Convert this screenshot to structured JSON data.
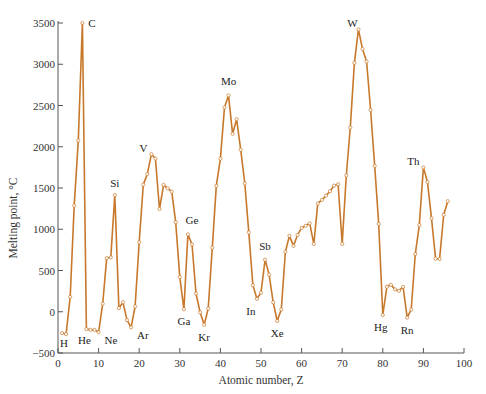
{
  "chart_data": {
    "type": "line",
    "title": "",
    "xlabel": "Atomic number, Z",
    "ylabel": "Melting point, °C",
    "xlim": [
      0,
      100
    ],
    "ylim": [
      -500,
      3500
    ],
    "xticks": [
      0,
      10,
      20,
      30,
      40,
      50,
      60,
      70,
      80,
      90,
      100
    ],
    "yticks": [
      -500,
      0,
      500,
      1000,
      1500,
      2000,
      2500,
      3000,
      3500
    ],
    "grid": false,
    "legend": null,
    "line_color": "#c8782a",
    "marker": "open-circle",
    "series": [
      {
        "name": "Melting point",
        "x": [
          1,
          2,
          3,
          4,
          5,
          6,
          7,
          8,
          9,
          10,
          11,
          12,
          13,
          14,
          15,
          16,
          17,
          18,
          19,
          20,
          21,
          22,
          23,
          24,
          25,
          26,
          27,
          28,
          29,
          30,
          31,
          32,
          33,
          34,
          35,
          36,
          37,
          38,
          39,
          40,
          41,
          42,
          43,
          44,
          45,
          46,
          47,
          48,
          49,
          50,
          51,
          52,
          53,
          54,
          55,
          56,
          57,
          58,
          59,
          60,
          61,
          62,
          63,
          64,
          65,
          66,
          67,
          68,
          69,
          70,
          71,
          72,
          73,
          74,
          75,
          76,
          77,
          78,
          79,
          80,
          81,
          82,
          83,
          84,
          85,
          86,
          87,
          88,
          89,
          90,
          91,
          92,
          93,
          94,
          95,
          96
        ],
        "values": [
          -259,
          -272,
          181,
          1287,
          2076,
          3500,
          -210,
          -218,
          -220,
          -249,
          98,
          650,
          660,
          1414,
          44,
          115,
          -102,
          -189,
          64,
          842,
          1541,
          1668,
          1910,
          1857,
          1246,
          1538,
          1495,
          1455,
          1085,
          420,
          30,
          938,
          817,
          221,
          -7,
          -157,
          39,
          777,
          1526,
          1855,
          2477,
          2623,
          2157,
          2334,
          1964,
          1555,
          962,
          321,
          157,
          232,
          631,
          450,
          114,
          -112,
          28,
          727,
          920,
          798,
          931,
          1016,
          1042,
          1072,
          822,
          1313,
          1356,
          1407,
          1461,
          1529,
          1545,
          824,
          1652,
          2233,
          3017,
          3422,
          3186,
          3033,
          2446,
          1768,
          1064,
          -39,
          304,
          327,
          271,
          254,
          302,
          -71,
          27,
          700,
          1050,
          1750,
          1572,
          1132,
          644,
          640,
          1176,
          1340
        ]
      }
    ],
    "annotations": [
      {
        "z": 1,
        "label": "H"
      },
      {
        "z": 2,
        "label": "He"
      },
      {
        "z": 6,
        "label": "C"
      },
      {
        "z": 10,
        "label": "Ne"
      },
      {
        "z": 14,
        "label": "Si"
      },
      {
        "z": 18,
        "label": "Ar"
      },
      {
        "z": 23,
        "label": "V"
      },
      {
        "z": 31,
        "label": "Ga"
      },
      {
        "z": 32,
        "label": "Ge"
      },
      {
        "z": 36,
        "label": "Kr"
      },
      {
        "z": 42,
        "label": "Mo"
      },
      {
        "z": 49,
        "label": "In"
      },
      {
        "z": 51,
        "label": "Sb"
      },
      {
        "z": 54,
        "label": "Xe"
      },
      {
        "z": 74,
        "label": "W"
      },
      {
        "z": 80,
        "label": "Hg"
      },
      {
        "z": 86,
        "label": "Rn"
      },
      {
        "z": 90,
        "label": "Th"
      }
    ]
  }
}
